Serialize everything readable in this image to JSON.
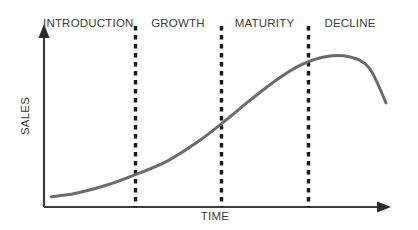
{
  "diagram": {
    "stages": [
      {
        "key": "introduction",
        "label": "INTRODUCTION"
      },
      {
        "key": "growth",
        "label": "GROWTH"
      },
      {
        "key": "maturity",
        "label": "MATURITY"
      },
      {
        "key": "decline",
        "label": "DECLINE"
      }
    ],
    "axes": {
      "y_label": "SALES",
      "x_label": "TIME"
    },
    "colors": {
      "background": "#ffffff",
      "axis": "#3d3d3d",
      "curve": "#6b6b6b",
      "divider": "#1a1a1a",
      "text": "#3a3a3a"
    }
  },
  "chart_data": {
    "type": "line",
    "title": "",
    "xlabel": "TIME",
    "ylabel": "SALES",
    "grid": false,
    "legend": null,
    "axis_ranges": {
      "x": [
        0,
        1
      ],
      "y": [
        0,
        1
      ]
    },
    "series": [
      {
        "name": "Sales",
        "comment": "Product life cycle S-curve: normalized x (0=origin,1=right edge of plot), y (0=axis baseline, 1=top of plot)",
        "x": [
          0.01,
          0.08,
          0.17,
          0.26,
          0.35,
          0.44,
          0.52,
          0.6,
          0.68,
          0.75,
          0.82,
          0.89,
          0.95,
          1.0
        ],
        "y": [
          0.04,
          0.06,
          0.11,
          0.18,
          0.26,
          0.38,
          0.51,
          0.65,
          0.78,
          0.87,
          0.92,
          0.92,
          0.85,
          0.63
        ]
      }
    ],
    "stage_boundaries": [
      {
        "after": "INTRODUCTION",
        "x": 0.26
      },
      {
        "after": "GROWTH",
        "x": 0.51
      },
      {
        "after": "MATURITY",
        "x": 0.76
      }
    ],
    "annotations": [
      {
        "text": "INTRODUCTION",
        "x_range": [
          0.0,
          0.26
        ]
      },
      {
        "text": "GROWTH",
        "x_range": [
          0.26,
          0.51
        ]
      },
      {
        "text": "MATURITY",
        "x_range": [
          0.51,
          0.76
        ]
      },
      {
        "text": "DECLINE",
        "x_range": [
          0.76,
          1.0
        ]
      }
    ],
    "peak": {
      "x": 0.73,
      "y": 0.93
    }
  }
}
